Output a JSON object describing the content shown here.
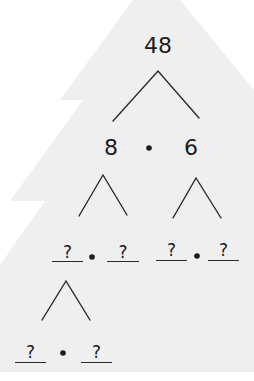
{
  "diagram": {
    "type": "factor-tree",
    "background_shape": "christmas-tree",
    "colors": {
      "tree_fill": "#efefef",
      "ink": "#1c1c1c",
      "page": "#ffffff"
    },
    "root": {
      "value": "48"
    },
    "level1": {
      "left": "8",
      "operator": "•",
      "right": "6"
    },
    "level2": {
      "left_pair": {
        "a": "?",
        "operator": "•",
        "b": "?"
      },
      "right_pair": {
        "a": "?",
        "operator": "•",
        "b": "?"
      }
    },
    "level3": {
      "pair": {
        "a": "?",
        "operator": "•",
        "b": "?"
      }
    }
  }
}
